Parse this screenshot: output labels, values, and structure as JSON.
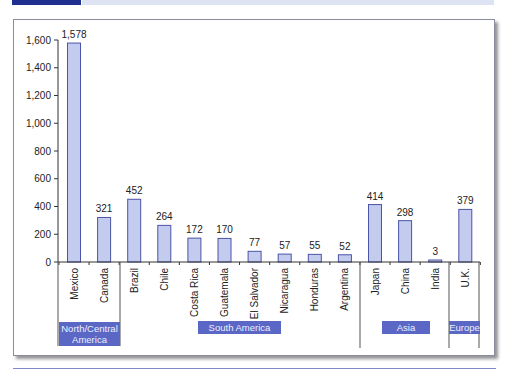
{
  "chart_data": {
    "type": "bar",
    "title": "",
    "xlabel": "",
    "ylabel": "",
    "ylim": [
      0,
      1600
    ],
    "yticks": [
      "0",
      "200",
      "400",
      "600",
      "800",
      "1,000",
      "1,200",
      "1,400",
      "1,600"
    ],
    "grid": false,
    "categories": [
      "Mexico",
      "Canada",
      "Brazil",
      "Chile",
      "Costa Rica",
      "Guatemala",
      "El Salvador",
      "Nicaragua",
      "Honduras",
      "Argentina",
      "Japan",
      "China",
      "India",
      "U.K."
    ],
    "values": [
      1578,
      321,
      452,
      264,
      172,
      170,
      77,
      57,
      55,
      52,
      414,
      298,
      3,
      379
    ],
    "value_labels": [
      "1,578",
      "321",
      "452",
      "264",
      "172",
      "170",
      "77",
      "57",
      "55",
      "52",
      "414",
      "298",
      "3",
      "379"
    ],
    "groups": [
      {
        "name": "North/Central America",
        "label_lines": [
          "North/Central",
          "America"
        ],
        "categories": [
          "Mexico",
          "Canada"
        ]
      },
      {
        "name": "South America",
        "label_lines": [
          "South America"
        ],
        "categories": [
          "Brazil",
          "Chile",
          "Costa Rica",
          "Guatemala",
          "El Salvador",
          "Nicaragua",
          "Honduras",
          "Argentina"
        ]
      },
      {
        "name": "Asia",
        "label_lines": [
          "Asia"
        ],
        "categories": [
          "Japan",
          "China",
          "India"
        ]
      },
      {
        "name": "Europe",
        "label_lines": [
          "Europe"
        ],
        "categories": [
          "U.K."
        ]
      }
    ],
    "legend": null
  },
  "colors": {
    "bar_fill": "#c3cbee",
    "bar_stroke": "#4b54a6",
    "group_label_bg": "#5a67c4",
    "group_label_text": "#eef0ff",
    "axis": "#333333",
    "banner_dark": "#1f2f8f",
    "banner_light": "#dde3f3"
  }
}
